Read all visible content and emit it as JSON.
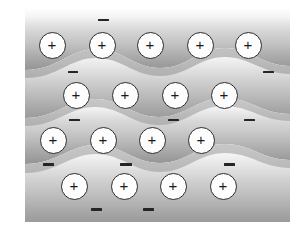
{
  "figure": {
    "width": 298,
    "height": 228,
    "background_color": "#ffffff"
  },
  "lattice": {
    "ion_label": "+",
    "ion_semantic": "positive-metal-ion",
    "ion_radius": 13.5,
    "ion_fill_color": "#fdfdfd",
    "ion_border_color": "#2b2b2b",
    "ion_text_color": "#1a1a1a",
    "rows": [
      {
        "row_index": 1,
        "count": 5,
        "cy": 45,
        "ions": [
          {
            "cx": 52,
            "cy": 45,
            "label": "+"
          },
          {
            "cx": 102,
            "cy": 45,
            "label": "+"
          },
          {
            "cx": 150,
            "cy": 45,
            "label": "+"
          },
          {
            "cx": 200,
            "cy": 45,
            "label": "+"
          },
          {
            "cx": 248,
            "cy": 45,
            "label": "+"
          }
        ]
      },
      {
        "row_index": 2,
        "count": 4,
        "cy": 95,
        "ions": [
          {
            "cx": 76,
            "cy": 95,
            "label": "+"
          },
          {
            "cx": 125,
            "cy": 95,
            "label": "+"
          },
          {
            "cx": 175,
            "cy": 95,
            "label": "+"
          },
          {
            "cx": 224,
            "cy": 95,
            "label": "+"
          }
        ]
      },
      {
        "row_index": 3,
        "count": 4,
        "cy": 140,
        "ions": [
          {
            "cx": 53,
            "cy": 140,
            "label": "+"
          },
          {
            "cx": 103,
            "cy": 140,
            "label": "+"
          },
          {
            "cx": 152,
            "cy": 140,
            "label": "+"
          },
          {
            "cx": 201,
            "cy": 140,
            "label": "+"
          }
        ]
      },
      {
        "row_index": 4,
        "count": 4,
        "cy": 186,
        "ions": [
          {
            "cx": 74,
            "cy": 186,
            "label": "+"
          },
          {
            "cx": 124,
            "cy": 186,
            "label": "+"
          },
          {
            "cx": 173,
            "cy": 186,
            "label": "+"
          },
          {
            "cx": 223,
            "cy": 186,
            "label": "+"
          }
        ]
      }
    ]
  },
  "electrons": {
    "label": "-",
    "semantic": "delocalized-electron",
    "color": "#252525",
    "count": 11,
    "marks": [
      {
        "cx": 103,
        "cy": 20,
        "width": 11,
        "height": 2.5
      },
      {
        "cx": 73,
        "cy": 72,
        "width": 10,
        "height": 2.5
      },
      {
        "cx": 268,
        "cy": 72,
        "width": 11,
        "height": 2.5
      },
      {
        "cx": 74,
        "cy": 120,
        "width": 11,
        "height": 2.5
      },
      {
        "cx": 173,
        "cy": 120,
        "width": 11,
        "height": 2.5
      },
      {
        "cx": 249,
        "cy": 120,
        "width": 11,
        "height": 2.5
      },
      {
        "cx": 48,
        "cy": 164,
        "width": 11,
        "height": 3
      },
      {
        "cx": 126,
        "cy": 164,
        "width": 12,
        "height": 3
      },
      {
        "cx": 229,
        "cy": 164,
        "width": 11,
        "height": 3
      },
      {
        "cx": 96,
        "cy": 209,
        "width": 11,
        "height": 3
      },
      {
        "cx": 148,
        "cy": 209,
        "width": 11,
        "height": 3
      }
    ]
  },
  "electron_sea": {
    "semantic": "electron-sea-background",
    "description": "Four horizontal wavy gradient bands representing the delocalized electron sea",
    "left_edge": 25,
    "right_edge": 290,
    "top_edge": 8,
    "bottom_edge": 222,
    "band_count": 4,
    "band_top_color": "#ffffff",
    "band_mid_color": "#dcdcdc",
    "band_dark_color": "#9a9a9a",
    "band_edge_color": "#8e8e8e",
    "bands": [
      {
        "index": 1,
        "top": 8,
        "bottom": 64,
        "wave_amplitude": 9,
        "wave_phase": 0.0
      },
      {
        "index": 2,
        "top": 64,
        "bottom": 112,
        "wave_amplitude": 8,
        "wave_phase": 0.9
      },
      {
        "index": 3,
        "top": 112,
        "bottom": 158,
        "wave_amplitude": 8,
        "wave_phase": 1.8
      },
      {
        "index": 4,
        "top": 158,
        "bottom": 222,
        "wave_amplitude": 8,
        "wave_phase": 2.7
      }
    ]
  }
}
